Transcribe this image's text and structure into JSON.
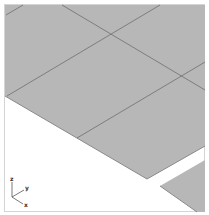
{
  "scene": {
    "background_color": "#ffffff",
    "frame_color": "#cfcfcf",
    "plate_color": "#b5b5b5",
    "grid_line_color": "#6f6f6f",
    "plate_edge_color": "#8a8a8a"
  },
  "axis_triad": {
    "labels": {
      "z": "z",
      "y": "y",
      "x": "x"
    }
  }
}
